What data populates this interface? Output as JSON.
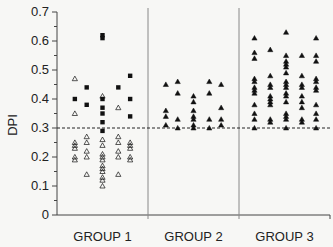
{
  "chart_data": {
    "type": "scatter",
    "title": "",
    "xlabel": "",
    "ylabel": "DPI",
    "ylim": [
      0,
      0.7
    ],
    "yticks": [
      0,
      0.1,
      0.2,
      0.3,
      0.4,
      0.5,
      0.6,
      0.7
    ],
    "ytick_labels": [
      "0",
      "0.1",
      "0.2",
      "0.3",
      "0.4",
      "0.5",
      "0.6",
      "0.7"
    ],
    "categories": [
      "GROUP 1",
      "GROUP 2",
      "GROUP 3"
    ],
    "grid": false,
    "reference_line": {
      "y": 0.3,
      "style": "dashed"
    },
    "series": [
      {
        "name": "GROUP 1 squares (filled)",
        "marker": "filled-square",
        "group": "GROUP 1",
        "points": [
          [
            0.15,
            0.4
          ],
          [
            0.3,
            0.44
          ],
          [
            0.3,
            0.38
          ],
          [
            0.5,
            0.62
          ],
          [
            0.5,
            0.61
          ],
          [
            0.5,
            0.4
          ],
          [
            0.5,
            0.37
          ],
          [
            0.5,
            0.35
          ],
          [
            0.5,
            0.32
          ],
          [
            0.5,
            0.29
          ],
          [
            0.7,
            0.44
          ],
          [
            0.85,
            0.48
          ],
          [
            0.85,
            0.4
          ],
          [
            0.85,
            0.34
          ]
        ]
      },
      {
        "name": "GROUP 1 triangles (open)",
        "marker": "open-triangle",
        "group": "GROUP 1",
        "points": [
          [
            0.15,
            0.47
          ],
          [
            0.15,
            0.35
          ],
          [
            0.15,
            0.25
          ],
          [
            0.15,
            0.24
          ],
          [
            0.15,
            0.23
          ],
          [
            0.15,
            0.2
          ],
          [
            0.15,
            0.19
          ],
          [
            0.3,
            0.27
          ],
          [
            0.3,
            0.25
          ],
          [
            0.3,
            0.22
          ],
          [
            0.3,
            0.2
          ],
          [
            0.3,
            0.14
          ],
          [
            0.5,
            0.41
          ],
          [
            0.5,
            0.26
          ],
          [
            0.5,
            0.24
          ],
          [
            0.5,
            0.21
          ],
          [
            0.5,
            0.2
          ],
          [
            0.5,
            0.19
          ],
          [
            0.5,
            0.17
          ],
          [
            0.5,
            0.16
          ],
          [
            0.5,
            0.15
          ],
          [
            0.5,
            0.13
          ],
          [
            0.5,
            0.12
          ],
          [
            0.5,
            0.1
          ],
          [
            0.7,
            0.37
          ],
          [
            0.7,
            0.27
          ],
          [
            0.7,
            0.25
          ],
          [
            0.7,
            0.22
          ],
          [
            0.7,
            0.2
          ],
          [
            0.7,
            0.14
          ],
          [
            0.85,
            0.25
          ],
          [
            0.85,
            0.24
          ],
          [
            0.85,
            0.23
          ],
          [
            0.85,
            0.2
          ],
          [
            0.85,
            0.19
          ]
        ]
      },
      {
        "name": "GROUP 2 triangles (filled)",
        "marker": "filled-triangle",
        "group": "GROUP 2",
        "points": [
          [
            0.15,
            0.45
          ],
          [
            0.15,
            0.36
          ],
          [
            0.15,
            0.34
          ],
          [
            0.15,
            0.31
          ],
          [
            0.3,
            0.46
          ],
          [
            0.3,
            0.42
          ],
          [
            0.3,
            0.33
          ],
          [
            0.3,
            0.3
          ],
          [
            0.5,
            0.41
          ],
          [
            0.5,
            0.39
          ],
          [
            0.5,
            0.36
          ],
          [
            0.5,
            0.34
          ],
          [
            0.5,
            0.33
          ],
          [
            0.5,
            0.31
          ],
          [
            0.5,
            0.3
          ],
          [
            0.7,
            0.46
          ],
          [
            0.7,
            0.42
          ],
          [
            0.7,
            0.33
          ],
          [
            0.7,
            0.3
          ],
          [
            0.85,
            0.45
          ],
          [
            0.85,
            0.37
          ],
          [
            0.85,
            0.33
          ],
          [
            0.85,
            0.31
          ]
        ]
      },
      {
        "name": "GROUP 3 triangles (filled)",
        "marker": "filled-triangle",
        "group": "GROUP 3",
        "points": [
          [
            0.12,
            0.61
          ],
          [
            0.12,
            0.56
          ],
          [
            0.12,
            0.54
          ],
          [
            0.12,
            0.47
          ],
          [
            0.12,
            0.46
          ],
          [
            0.12,
            0.44
          ],
          [
            0.12,
            0.43
          ],
          [
            0.12,
            0.42
          ],
          [
            0.12,
            0.38
          ],
          [
            0.12,
            0.35
          ],
          [
            0.12,
            0.33
          ],
          [
            0.12,
            0.3
          ],
          [
            0.32,
            0.57
          ],
          [
            0.32,
            0.48
          ],
          [
            0.32,
            0.45
          ],
          [
            0.32,
            0.44
          ],
          [
            0.32,
            0.41
          ],
          [
            0.32,
            0.4
          ],
          [
            0.32,
            0.39
          ],
          [
            0.32,
            0.38
          ],
          [
            0.32,
            0.33
          ],
          [
            0.32,
            0.32
          ],
          [
            0.52,
            0.63
          ],
          [
            0.52,
            0.55
          ],
          [
            0.52,
            0.53
          ],
          [
            0.52,
            0.52
          ],
          [
            0.52,
            0.51
          ],
          [
            0.52,
            0.49
          ],
          [
            0.52,
            0.46
          ],
          [
            0.52,
            0.45
          ],
          [
            0.52,
            0.44
          ],
          [
            0.52,
            0.42
          ],
          [
            0.52,
            0.41
          ],
          [
            0.52,
            0.39
          ],
          [
            0.52,
            0.35
          ],
          [
            0.52,
            0.34
          ],
          [
            0.52,
            0.33
          ],
          [
            0.52,
            0.3
          ],
          [
            0.72,
            0.55
          ],
          [
            0.72,
            0.48
          ],
          [
            0.72,
            0.45
          ],
          [
            0.72,
            0.44
          ],
          [
            0.72,
            0.41
          ],
          [
            0.72,
            0.39
          ],
          [
            0.72,
            0.37
          ],
          [
            0.72,
            0.33
          ],
          [
            0.72,
            0.32
          ],
          [
            0.9,
            0.61
          ],
          [
            0.9,
            0.55
          ],
          [
            0.9,
            0.53
          ],
          [
            0.9,
            0.47
          ],
          [
            0.9,
            0.46
          ],
          [
            0.9,
            0.44
          ],
          [
            0.9,
            0.43
          ],
          [
            0.9,
            0.38
          ],
          [
            0.9,
            0.35
          ],
          [
            0.9,
            0.33
          ],
          [
            0.9,
            0.3
          ]
        ]
      }
    ]
  },
  "colors": {
    "background": "#f7f7f5",
    "axis": "#444444",
    "marker": "#111111"
  }
}
